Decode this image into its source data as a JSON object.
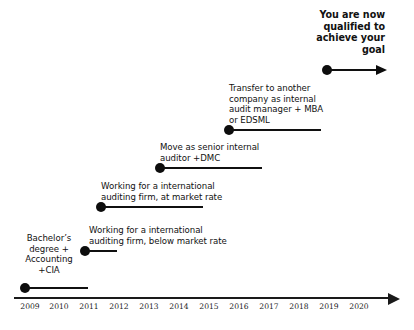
{
  "diagram": {
    "background_color": "#ffffff",
    "ink_color": "#101010"
  },
  "axis": {
    "label": "Year",
    "start_year": 2009,
    "end_year": 2020,
    "has_arrow_head": true,
    "ticks": [
      {
        "label": "2009",
        "x": 19
      },
      {
        "label": "2010",
        "x": 48
      },
      {
        "label": "2011",
        "x": 78
      },
      {
        "label": "2012",
        "x": 108
      },
      {
        "label": "2013",
        "x": 138
      },
      {
        "label": "2014",
        "x": 168
      },
      {
        "label": "2015",
        "x": 198
      },
      {
        "label": "2016",
        "x": 228
      },
      {
        "label": "2017",
        "x": 258
      },
      {
        "label": "2018",
        "x": 288
      },
      {
        "label": "2019",
        "x": 318
      },
      {
        "label": "2020",
        "x": 348
      }
    ]
  },
  "milestones": [
    {
      "id": "goal",
      "text": "You are now\nqualified to\nachieve your\ngoal",
      "bold": true,
      "align": "right",
      "start_year": 2019,
      "has_arrow_head": true
    },
    {
      "id": "transfer-audit-manager",
      "text": "Transfer to another\ncompany as internal\naudit manager + MBA\nor EDSML",
      "bold": false,
      "align": "left",
      "start_year": 2016,
      "has_arrow_head": false
    },
    {
      "id": "senior-internal-auditor",
      "text": "Move as senior internal\nauditor  +DMC",
      "bold": false,
      "align": "left",
      "start_year": 2014,
      "has_arrow_head": false
    },
    {
      "id": "international-firm-market-rate",
      "text": "Working for a international\nauditing firm, at market rate",
      "bold": false,
      "align": "left",
      "start_year": 2012,
      "has_arrow_head": false
    },
    {
      "id": "international-firm-below-market-rate",
      "text": "Working for a international\nauditing firm, below market rate",
      "bold": false,
      "align": "left",
      "start_year": 2011,
      "has_arrow_head": false
    },
    {
      "id": "bachelors-degree",
      "text": "Bachelor’s\ndegree  +\nAccounting\n+CIA",
      "bold": false,
      "align": "center",
      "start_year": 2009,
      "has_arrow_head": false
    }
  ]
}
